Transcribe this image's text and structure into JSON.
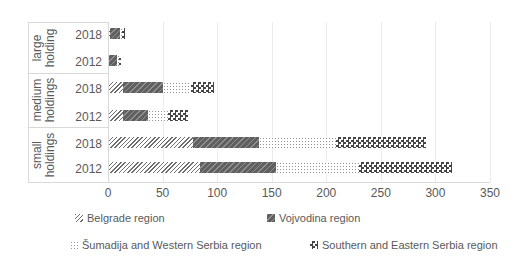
{
  "chart_data": {
    "type": "bar",
    "orientation": "horizontal-stacked",
    "title": "",
    "xlabel": "",
    "ylabel": "",
    "xlim": [
      0,
      350
    ],
    "x_ticks": [
      0,
      50,
      100,
      150,
      200,
      250,
      300,
      350
    ],
    "gridlines": true,
    "legend_position": "bottom",
    "group_labels": [
      "large holding",
      "medium holdings",
      "small holdings"
    ],
    "categories": [
      "large holding 2018",
      "large holding 2012",
      "medium holdings 2018",
      "medium holdings 2012",
      "small holdings 2018",
      "small holdings 2012"
    ],
    "year_labels": [
      "2018",
      "2012",
      "2018",
      "2012",
      "2018",
      "2012"
    ],
    "series": [
      {
        "name": "Belgrade region",
        "pattern": "light-upward-diagonal-hatch",
        "color": "#6e6e6e",
        "values": [
          2,
          1,
          14,
          14,
          78,
          84
        ]
      },
      {
        "name": "Vojvodina region",
        "pattern": "dark-wide-upward-diagonal",
        "color": "#606060",
        "values": [
          9,
          7,
          36,
          23,
          60,
          70
        ]
      },
      {
        "name": "Šumadija and Western Serbia region",
        "pattern": "light-dotted-grid",
        "color": "#949494",
        "values": [
          2,
          2,
          26,
          18,
          71,
          76
        ]
      },
      {
        "name": "Southern and Eastern Serbia region",
        "pattern": "dark-checkerboard",
        "color": "#454545",
        "values": [
          3,
          2,
          21,
          18,
          82,
          85
        ]
      }
    ],
    "totals": [
      16,
      12,
      97,
      73,
      291,
      315
    ]
  },
  "colors": {
    "text": "#595959",
    "gridline": "#ebebeb",
    "axis": "#d9d9d9",
    "background": "#ffffff"
  }
}
